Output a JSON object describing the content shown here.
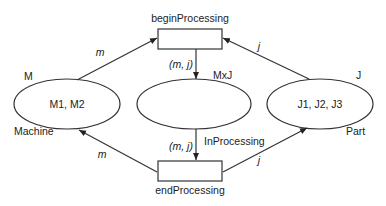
{
  "diagram": {
    "type": "petri-net",
    "places": [
      {
        "id": "machine",
        "tokens": "M1, M2",
        "type_label": "M",
        "name": "Machine"
      },
      {
        "id": "inprocessing",
        "tokens": "",
        "type_label": "MxJ",
        "name": "InProcessing"
      },
      {
        "id": "part",
        "tokens": "J1, J2, J3",
        "type_label": "J",
        "name": "Part"
      }
    ],
    "transitions": [
      {
        "id": "begin",
        "name": "beginProcessing"
      },
      {
        "id": "end",
        "name": "endProcessing"
      }
    ],
    "arcs": [
      {
        "from": "machine",
        "to": "begin",
        "label": "m"
      },
      {
        "from": "part",
        "to": "begin",
        "label": "j"
      },
      {
        "from": "begin",
        "to": "inprocessing",
        "label": "(m, j)"
      },
      {
        "from": "inprocessing",
        "to": "end",
        "label": "(m, j)"
      },
      {
        "from": "end",
        "to": "machine",
        "label": "m"
      },
      {
        "from": "end",
        "to": "part",
        "label": "j"
      }
    ]
  }
}
